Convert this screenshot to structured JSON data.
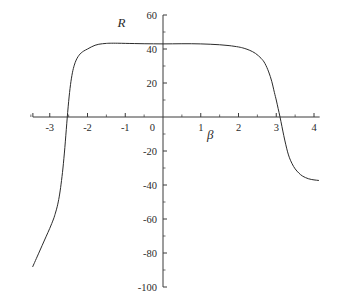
{
  "chart_data": {
    "type": "line",
    "title": "",
    "xlabel": "β",
    "ylabel": "R",
    "xlim": [
      -3.5,
      4.15
    ],
    "ylim": [
      -100,
      60
    ],
    "grid": false,
    "legend": "none",
    "x_ticks": [
      -3,
      -2,
      -1,
      0,
      1,
      2,
      3,
      4
    ],
    "x_tick_labels": [
      "-3",
      "-2",
      "-1",
      "0",
      "1",
      "2",
      "3",
      "4"
    ],
    "x_minor_tick_step": 0.5,
    "y_ticks": [
      60,
      40,
      20,
      0,
      -20,
      -40,
      -60,
      -80,
      -100
    ],
    "y_tick_labels": [
      "60",
      "40",
      "20",
      "0",
      "-20",
      "-40",
      "-60",
      "-80",
      "-100"
    ],
    "y_minor_tick_step": 10,
    "series": [
      {
        "name": "R(β)",
        "color": "#2b2b2b",
        "x": [
          -3.45,
          -3.4,
          -3.3,
          -3.2,
          -3.1,
          -3.0,
          -2.9,
          -2.85,
          -2.8,
          -2.75,
          -2.7,
          -2.65,
          -2.6,
          -2.55,
          -2.5,
          -2.45,
          -2.4,
          -2.35,
          -2.3,
          -2.25,
          -2.2,
          -2.15,
          -2.1,
          -2.0,
          -1.9,
          -1.8,
          -1.7,
          -1.6,
          -1.5,
          -1.4,
          -1.2,
          -1.0,
          -0.75,
          -0.5,
          -0.25,
          0.0,
          0.25,
          0.5,
          0.75,
          1.0,
          1.25,
          1.5,
          1.75,
          2.0,
          2.15,
          2.3,
          2.45,
          2.6,
          2.7,
          2.8,
          2.88,
          2.95,
          3.0,
          3.05,
          3.1,
          3.15,
          3.2,
          3.25,
          3.3,
          3.35,
          3.42,
          3.5,
          3.6,
          3.7,
          3.85,
          4.0,
          4.12
        ],
        "y": [
          -88.0,
          -85.5,
          -80.5,
          -75.5,
          -70.5,
          -65.5,
          -60.0,
          -56.5,
          -52.5,
          -47.0,
          -39.5,
          -30.0,
          -18.0,
          -4.0,
          9.0,
          19.0,
          26.0,
          30.5,
          33.5,
          35.5,
          37.0,
          38.0,
          38.8,
          40.0,
          41.2,
          42.2,
          42.8,
          43.1,
          43.3,
          43.4,
          43.4,
          43.3,
          43.2,
          43.1,
          43.05,
          43.0,
          43.05,
          43.1,
          43.1,
          43.0,
          42.8,
          42.5,
          42.0,
          41.2,
          40.4,
          39.2,
          37.4,
          34.5,
          31.5,
          26.5,
          21.0,
          14.5,
          10.0,
          5.0,
          0.0,
          -5.5,
          -11.0,
          -16.0,
          -20.5,
          -24.0,
          -27.5,
          -30.5,
          -33.0,
          -34.8,
          -36.3,
          -37.0,
          -37.3
        ]
      }
    ],
    "axis_label_positions": {
      "ylabel_xy": [
        -1.1,
        53
      ],
      "xlabel_xy": [
        1.25,
        -13
      ]
    }
  },
  "axes": {
    "origin_label": "0",
    "x_axis_name": "β",
    "y_axis_name": "R"
  }
}
